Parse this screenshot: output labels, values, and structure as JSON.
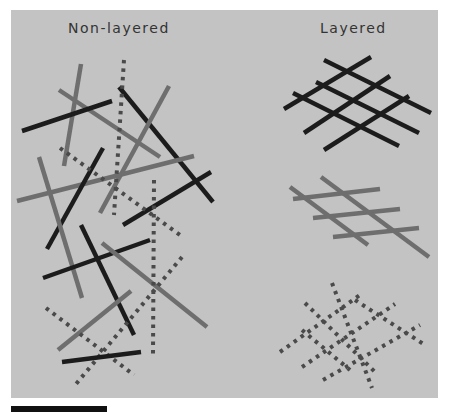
{
  "figure": {
    "labels": {
      "left": "Non-layered",
      "right": "Layered"
    },
    "colors": {
      "background": "#c3c3c3",
      "black_line": "#1c1c1c",
      "gray_line": "#6e6e6e",
      "dotted_line": "#4a4a4a",
      "scale_bar": "#111111"
    },
    "non_layered": {
      "lines": [
        {
          "style": "gray",
          "x1": 81,
          "y1": 64,
          "x2": 64,
          "y2": 166
        },
        {
          "style": "gray",
          "x1": 59,
          "y1": 90,
          "x2": 160,
          "y2": 157
        },
        {
          "style": "black",
          "x1": 22,
          "y1": 131,
          "x2": 112,
          "y2": 101
        },
        {
          "style": "black",
          "x1": 119,
          "y1": 87,
          "x2": 213,
          "y2": 202
        },
        {
          "style": "gray",
          "x1": 169,
          "y1": 86,
          "x2": 100,
          "y2": 213
        },
        {
          "style": "gray",
          "x1": 17,
          "y1": 201,
          "x2": 194,
          "y2": 156
        },
        {
          "style": "black",
          "x1": 103,
          "y1": 148,
          "x2": 47,
          "y2": 249
        },
        {
          "style": "black",
          "x1": 123,
          "y1": 225,
          "x2": 211,
          "y2": 172
        },
        {
          "style": "dotted",
          "x1": 124,
          "y1": 60,
          "x2": 114,
          "y2": 215
        },
        {
          "style": "dotted",
          "x1": 60,
          "y1": 148,
          "x2": 180,
          "y2": 235
        },
        {
          "style": "gray",
          "x1": 39,
          "y1": 157,
          "x2": 82,
          "y2": 298
        },
        {
          "style": "black",
          "x1": 81,
          "y1": 225,
          "x2": 134,
          "y2": 335
        },
        {
          "style": "black",
          "x1": 43,
          "y1": 278,
          "x2": 150,
          "y2": 240
        },
        {
          "style": "gray",
          "x1": 102,
          "y1": 243,
          "x2": 207,
          "y2": 327
        },
        {
          "style": "dotted",
          "x1": 154,
          "y1": 180,
          "x2": 153,
          "y2": 355
        },
        {
          "style": "gray",
          "x1": 58,
          "y1": 350,
          "x2": 131,
          "y2": 291
        },
        {
          "style": "dotted",
          "x1": 46,
          "y1": 308,
          "x2": 134,
          "y2": 375
        },
        {
          "style": "dotted",
          "x1": 182,
          "y1": 257,
          "x2": 76,
          "y2": 384
        },
        {
          "style": "black",
          "x1": 62,
          "y1": 362,
          "x2": 141,
          "y2": 352
        }
      ]
    },
    "layered": {
      "black_layer": [
        {
          "x1": 284,
          "y1": 109,
          "x2": 371,
          "y2": 57
        },
        {
          "x1": 304,
          "y1": 133,
          "x2": 390,
          "y2": 76
        },
        {
          "x1": 324,
          "y1": 150,
          "x2": 409,
          "y2": 96
        },
        {
          "x1": 324,
          "y1": 60,
          "x2": 431,
          "y2": 113
        },
        {
          "x1": 316,
          "y1": 82,
          "x2": 419,
          "y2": 133
        },
        {
          "x1": 293,
          "y1": 93,
          "x2": 399,
          "y2": 146
        }
      ],
      "gray_layer": [
        {
          "x1": 293,
          "y1": 199,
          "x2": 380,
          "y2": 189
        },
        {
          "x1": 313,
          "y1": 218,
          "x2": 400,
          "y2": 209
        },
        {
          "x1": 333,
          "y1": 237,
          "x2": 419,
          "y2": 228
        },
        {
          "x1": 290,
          "y1": 187,
          "x2": 368,
          "y2": 245
        },
        {
          "x1": 321,
          "y1": 177,
          "x2": 429,
          "y2": 257
        }
      ],
      "dotted_layer": [
        {
          "x1": 280,
          "y1": 352,
          "x2": 360,
          "y2": 295
        },
        {
          "x1": 302,
          "y1": 367,
          "x2": 395,
          "y2": 304
        },
        {
          "x1": 323,
          "y1": 380,
          "x2": 420,
          "y2": 325
        },
        {
          "x1": 332,
          "y1": 283,
          "x2": 372,
          "y2": 388
        },
        {
          "x1": 305,
          "y1": 303,
          "x2": 375,
          "y2": 372
        },
        {
          "x1": 302,
          "y1": 330,
          "x2": 350,
          "y2": 370
        },
        {
          "x1": 355,
          "y1": 300,
          "x2": 425,
          "y2": 345
        }
      ]
    }
  }
}
